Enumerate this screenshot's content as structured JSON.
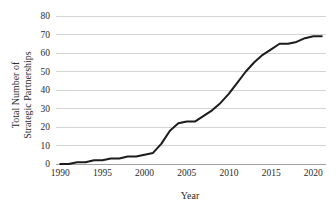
{
  "chart_data": {
    "type": "line",
    "title": "",
    "xlabel": "Year",
    "ylabel": "Total Number of Strategic Partnerships",
    "ylabel_line1": "Total Number of",
    "ylabel_line2": "Strategic Partnerships",
    "xlim": [
      1989.5,
      2021.5
    ],
    "ylim": [
      0,
      80
    ],
    "ytick_labels": [
      "0",
      "10",
      "20",
      "30",
      "40",
      "50",
      "60",
      "70",
      "80"
    ],
    "ytick_values": [
      0,
      10,
      20,
      30,
      40,
      50,
      60,
      70,
      80
    ],
    "xtick_labels": [
      "1990",
      "1995",
      "2000",
      "2005",
      "2010",
      "2015",
      "2020"
    ],
    "xtick_values": [
      1990,
      1995,
      2000,
      2005,
      2010,
      2015,
      2020
    ],
    "grid": "horizontal",
    "legend": "none",
    "series_name": "Total Number of Strategic Partnerships",
    "line_color": "#1c1c1c",
    "grid_color": "#c9c9c9",
    "axis_color": "#9a9a9a",
    "x": [
      1990,
      1991,
      1992,
      1993,
      1994,
      1995,
      1996,
      1997,
      1998,
      1999,
      2000,
      2001,
      2002,
      2003,
      2004,
      2005,
      2006,
      2007,
      2008,
      2009,
      2010,
      2011,
      2012,
      2013,
      2014,
      2015,
      2016,
      2017,
      2018,
      2019,
      2020,
      2021
    ],
    "values": [
      0,
      0,
      1,
      1,
      2,
      2,
      3,
      3,
      4,
      4,
      5,
      6,
      11,
      18,
      22,
      23,
      23,
      26,
      29,
      33,
      38,
      44,
      50,
      55,
      59,
      62,
      65,
      65,
      66,
      68,
      69,
      69
    ]
  }
}
